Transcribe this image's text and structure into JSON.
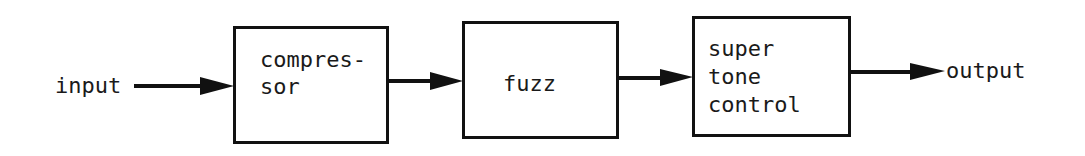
{
  "diagram": {
    "type": "signal-chain-block-diagram",
    "input_label": "input",
    "output_label": "output",
    "blocks": [
      {
        "id": "compressor",
        "lines": [
          "compres-",
          "sor"
        ]
      },
      {
        "id": "fuzz",
        "lines": [
          "fuzz"
        ]
      },
      {
        "id": "super-tone-control",
        "lines": [
          "super",
          "tone",
          "control"
        ]
      }
    ],
    "connections": [
      [
        "input",
        "compressor"
      ],
      [
        "compressor",
        "fuzz"
      ],
      [
        "fuzz",
        "super-tone-control"
      ],
      [
        "super-tone-control",
        "output"
      ]
    ],
    "colors": {
      "stroke": "#111111",
      "text": "#1a1a1a",
      "background": "#ffffff"
    }
  }
}
